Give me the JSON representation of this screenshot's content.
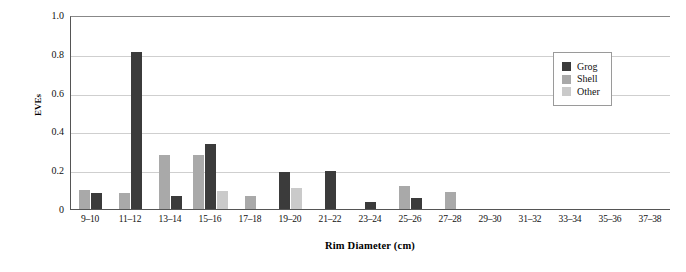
{
  "chart_data": {
    "type": "bar",
    "title": "",
    "subtitle": "",
    "xlabel": "Rim Diameter (cm)",
    "ylabel": "EVEs",
    "ylim": [
      0,
      1.0
    ],
    "yticks": [
      "0",
      "0.2",
      "0.4",
      "0.6",
      "0.8",
      "1.0"
    ],
    "ytick_values": [
      0,
      0.2,
      0.4,
      0.6,
      0.8,
      1.0
    ],
    "grid": "horizontal",
    "legend_position": "upper-right",
    "categories": [
      "9–10",
      "11–12",
      "13–14",
      "15–16",
      "17–18",
      "19–20",
      "21–22",
      "23–24",
      "25–26",
      "27–28",
      "29–30",
      "31–32",
      "33–34",
      "35–36",
      "37–38"
    ],
    "series": [
      {
        "name": "Grog",
        "color": "#3b3b3b",
        "values": [
          0.08,
          0.81,
          0.065,
          0.335,
          0,
          0.19,
          0.195,
          0.035,
          0.055,
          0,
          0,
          0,
          0,
          0,
          0
        ]
      },
      {
        "name": "Shell",
        "color": "#a9a9a9",
        "values": [
          0.1,
          0.08,
          0.28,
          0.28,
          0.065,
          0,
          0,
          0,
          0.12,
          0.09,
          0,
          0,
          0,
          0,
          0
        ]
      },
      {
        "name": "Other",
        "color": "#cacaca",
        "values": [
          0,
          0,
          0,
          0.095,
          0,
          0.11,
          0,
          0,
          0,
          0,
          0,
          0,
          0,
          0,
          0
        ]
      }
    ]
  },
  "legend": {
    "items": [
      {
        "label": "Grog",
        "color": "#3b3b3b"
      },
      {
        "label": "Shell",
        "color": "#a9a9a9"
      },
      {
        "label": "Other",
        "color": "#cacaca"
      }
    ]
  },
  "axes": {
    "y_title": "EVEs",
    "x_title": "Rim Diameter (cm)"
  }
}
